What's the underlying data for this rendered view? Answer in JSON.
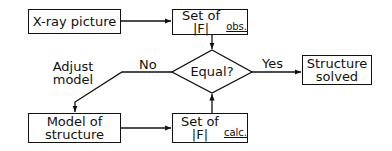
{
  "diagram": {
    "type": "flowchart",
    "nodes": {
      "xray": {
        "label": "X-ray picture"
      },
      "obs": {
        "label_main": "Set of |F|",
        "label_sub": "obs."
      },
      "decision": {
        "label": "Equal?"
      },
      "solved": {
        "line1": "Structure",
        "line2": "solved"
      },
      "model": {
        "line1": "Model of",
        "line2": "structure"
      },
      "calc": {
        "label_main": "Set of |F|",
        "label_sub": "calc."
      }
    },
    "edges": {
      "yes_label": "Yes",
      "no_label": "No",
      "adjust_line1": "Adjust",
      "adjust_line2": "model"
    },
    "colors": {
      "stroke": "#111111",
      "background": "#ffffff"
    }
  }
}
